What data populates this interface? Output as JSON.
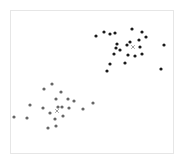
{
  "chart_data": {
    "type": "scatter",
    "title": "",
    "xlabel": "",
    "ylabel": "",
    "grid": false,
    "legend": null,
    "frame": {
      "x": 10,
      "y": 10,
      "width": 163,
      "height": 143,
      "color": "#e6e6e6"
    },
    "series": [
      {
        "name": "cluster-1",
        "color": "#1a1a1a",
        "points": [
          [
            96,
            36
          ],
          [
            104,
            32
          ],
          [
            110,
            34
          ],
          [
            115,
            33
          ],
          [
            132,
            29
          ],
          [
            142,
            32
          ],
          [
            146,
            37
          ],
          [
            139,
            40
          ],
          [
            130,
            42
          ],
          [
            127,
            45
          ],
          [
            140,
            47
          ],
          [
            116,
            48
          ],
          [
            120,
            50
          ],
          [
            114,
            54
          ],
          [
            128,
            55
          ],
          [
            135,
            56
          ],
          [
            142,
            54
          ],
          [
            125,
            63
          ],
          [
            110,
            64
          ],
          [
            107,
            71
          ],
          [
            161,
            69
          ],
          [
            164,
            45
          ],
          [
            117,
            44
          ]
        ],
        "centroid": [
          133,
          47
        ]
      },
      {
        "name": "cluster-2",
        "color": "#666666",
        "points": [
          [
            44,
            89
          ],
          [
            52,
            84
          ],
          [
            61,
            92
          ],
          [
            30,
            105
          ],
          [
            56,
            99
          ],
          [
            68,
            99
          ],
          [
            74,
            101
          ],
          [
            43,
            108
          ],
          [
            58,
            107
          ],
          [
            62,
            107
          ],
          [
            69,
            108
          ],
          [
            50,
            113
          ],
          [
            83,
            109
          ],
          [
            93,
            103
          ],
          [
            14,
            117
          ],
          [
            27,
            118
          ],
          [
            63,
            116
          ],
          [
            55,
            119
          ],
          [
            48,
            128
          ],
          [
            56,
            126
          ]
        ],
        "centroid": [
          57,
          111
        ]
      }
    ]
  }
}
